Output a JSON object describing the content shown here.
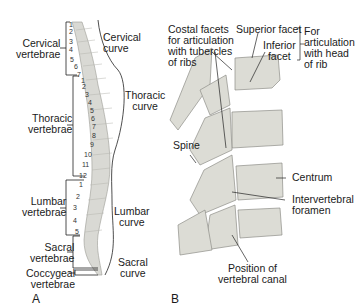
{
  "panel_a": {
    "letter": "A",
    "regions": {
      "cervical_vertebrae": "Cervical\nvertebrae",
      "thoracic_vertebrae": "Thoracic\nvertebrae",
      "lumbar_vertebrae": "Lumbar\nvertebrae",
      "sacral_vertebrae": "Sacral\nvertebrae",
      "coccygeal_vertebrae": "Coccygeal\nvertebrae"
    },
    "curves": {
      "cervical": "Cervical\ncurve",
      "thoracic": "Thoracic\ncurve",
      "lumbar": "Lumbar\ncurve",
      "sacral": "Sacral\ncurve"
    },
    "cervical_numbers": [
      "1",
      "2",
      "3",
      "4",
      "5",
      "6",
      "7"
    ],
    "thoracic_numbers": [
      "1",
      "2",
      "3",
      "4",
      "5",
      "6",
      "7",
      "8",
      "9",
      "10",
      "11",
      "12"
    ],
    "lumbar_numbers": [
      "1",
      "2",
      "3",
      "4",
      "5"
    ]
  },
  "panel_b": {
    "letter": "B",
    "labels": {
      "costal_facets": "Costal facets\nfor articulation\nwith tubercles\nof ribs",
      "superior_facet": "Superior facet",
      "inferior_facet": "Inferior\nfacet",
      "for_articulation": "For\narticulation\nwith head\nof rib",
      "spine": "Spine",
      "centrum": "Centrum",
      "intervertebral_foramen": "Intervertebral\nforamen",
      "vertebral_canal": "Position of\nvertebral canal"
    }
  }
}
